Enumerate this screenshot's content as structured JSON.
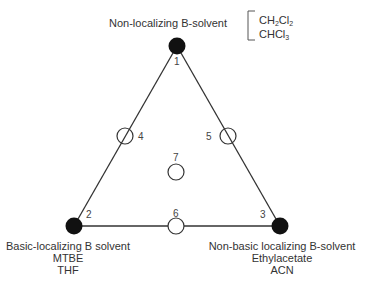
{
  "diagram": {
    "type": "solvent-selectivity-triangle",
    "vertices": [
      {
        "id": "1",
        "label": "Non-localizing B-solvent",
        "examples": [
          "CH2Cl2",
          "CHCl3"
        ],
        "x": 177,
        "y": 46
      },
      {
        "id": "2",
        "label": "Basic-localizing B solvent",
        "examples": [
          "MTBE",
          "THF"
        ],
        "x": 74,
        "y": 226
      },
      {
        "id": "3",
        "label": "Non-basic localizing B-solvent",
        "examples": [
          "Ethylacetate",
          "ACN"
        ],
        "x": 280,
        "y": 226
      }
    ],
    "midpoints": [
      {
        "id": "4",
        "x": 125,
        "y": 136
      },
      {
        "id": "5",
        "x": 228,
        "y": 136
      },
      {
        "id": "6",
        "x": 176,
        "y": 226
      },
      {
        "id": "7",
        "x": 176,
        "y": 172
      }
    ],
    "top_examples": {
      "line1": {
        "base": "CH",
        "sub1": "2",
        "mid": "Cl",
        "sub2": "2"
      },
      "line2": {
        "base": "CHCl",
        "sub1": "3"
      }
    },
    "colors": {
      "line": "#333333",
      "filled_node": "#111111",
      "open_node": "#ffffff"
    }
  }
}
